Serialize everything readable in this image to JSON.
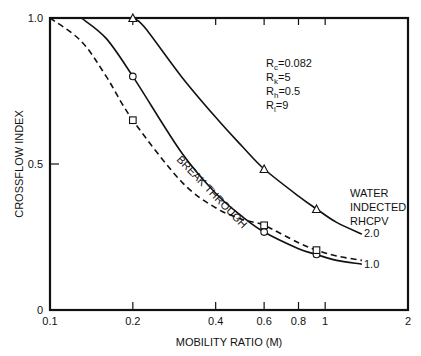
{
  "chart_data": {
    "type": "line",
    "title": "",
    "xlabel": "MOBILITY RATIO (M)",
    "ylabel": "CROSSFLOW INDEX",
    "x_scale": "log",
    "xlim": [
      0.1,
      2
    ],
    "ylim": [
      0,
      1.0
    ],
    "x_ticks": [
      0.1,
      0.2,
      0.4,
      0.6,
      0.8,
      1,
      2
    ],
    "x_tick_labels": [
      "0.1",
      "0.2",
      "0.4",
      "0.6",
      "0.8",
      "1",
      "2"
    ],
    "y_ticks": [
      0,
      0.5,
      1.0
    ],
    "y_tick_labels": [
      "0",
      "0.5",
      "1.0"
    ],
    "grid": false,
    "legend": null,
    "parameters": [
      "R_c=0.082",
      "R_k=5",
      "R_h=0.5",
      "R_l=9"
    ],
    "annotations": {
      "curve_group_label": [
        "WATER",
        "INDECTED",
        "RHCPV"
      ],
      "breakthrough_label": "BREAK THROUGH"
    },
    "series": [
      {
        "name": "2.0",
        "style": "solid",
        "marker": "triangle",
        "curve": [
          [
            0.2,
            1.0
          ],
          [
            0.22,
            0.97
          ],
          [
            0.3,
            0.8
          ],
          [
            0.4,
            0.66
          ],
          [
            0.5,
            0.56
          ],
          [
            0.6,
            0.483
          ],
          [
            0.8,
            0.39
          ],
          [
            0.93,
            0.346
          ],
          [
            1.1,
            0.3
          ],
          [
            1.36,
            0.26
          ]
        ],
        "points": [
          [
            0.2,
            1.0
          ],
          [
            0.6,
            0.483
          ],
          [
            0.93,
            0.346
          ]
        ]
      },
      {
        "name": "1.0",
        "style": "solid",
        "marker": "circle",
        "curve": [
          [
            0.13,
            1.0
          ],
          [
            0.16,
            0.93
          ],
          [
            0.2,
            0.8
          ],
          [
            0.3,
            0.54
          ],
          [
            0.4,
            0.4
          ],
          [
            0.5,
            0.32
          ],
          [
            0.6,
            0.267
          ],
          [
            0.8,
            0.21
          ],
          [
            0.93,
            0.19
          ],
          [
            1.1,
            0.17
          ],
          [
            1.36,
            0.157
          ]
        ],
        "points": [
          [
            0.2,
            0.8
          ],
          [
            0.6,
            0.267
          ],
          [
            0.93,
            0.19
          ]
        ]
      },
      {
        "name": "BREAK THROUGH",
        "style": "dashed",
        "marker": "square",
        "curve": [
          [
            0.1,
            1.0
          ],
          [
            0.13,
            0.92
          ],
          [
            0.16,
            0.8
          ],
          [
            0.2,
            0.65
          ],
          [
            0.3,
            0.44
          ],
          [
            0.4,
            0.35
          ],
          [
            0.5,
            0.31
          ],
          [
            0.6,
            0.29
          ],
          [
            0.8,
            0.23
          ],
          [
            0.93,
            0.205
          ],
          [
            1.1,
            0.185
          ],
          [
            1.36,
            0.17
          ]
        ],
        "points": [
          [
            0.2,
            0.65
          ],
          [
            0.6,
            0.29
          ],
          [
            0.93,
            0.205
          ]
        ]
      }
    ]
  },
  "labels": {
    "params": [
      {
        "main": "R",
        "sub": "c",
        "rest": "=0.082"
      },
      {
        "main": "R",
        "sub": "k",
        "rest": "=5"
      },
      {
        "main": "R",
        "sub": "h",
        "rest": "=0.5"
      },
      {
        "main": "R",
        "sub": "l",
        "rest": "=9"
      }
    ]
  }
}
